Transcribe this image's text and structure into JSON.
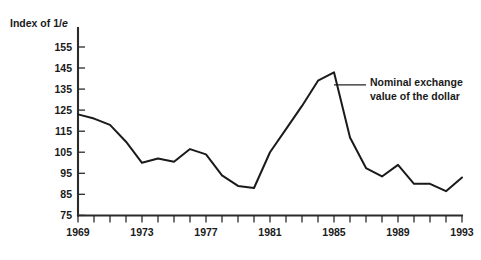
{
  "chart_data": {
    "type": "line",
    "title": "",
    "subtitle": "",
    "ylabel": "Index of 1/e",
    "ylabel_parts": {
      "prefix": "Index of 1/",
      "italic": "e"
    },
    "xlabel": "",
    "grid": false,
    "legend_position": "none",
    "ylim": [
      75,
      160
    ],
    "ytick_labels": [
      "155",
      "145",
      "135",
      "125",
      "115",
      "105",
      "95",
      "85",
      "75"
    ],
    "yticks": [
      155,
      145,
      135,
      125,
      115,
      105,
      95,
      85,
      75
    ],
    "xlim": [
      1969,
      1993
    ],
    "xtick_labels": [
      "1969",
      "1973",
      "1977",
      "1981",
      "1985",
      "1989",
      "1993"
    ],
    "xticks_labeled": [
      1969,
      1973,
      1977,
      1981,
      1985,
      1989,
      1993
    ],
    "xticks_minor": [
      1970,
      1971,
      1972,
      1974,
      1975,
      1976,
      1978,
      1979,
      1980,
      1982,
      1983,
      1984,
      1986,
      1987,
      1988,
      1990,
      1991,
      1992
    ],
    "series": [
      {
        "name": "Nominal exchange value of the dollar",
        "color": "#1a1a1a",
        "x": [
          1969,
          1970,
          1971,
          1972,
          1973,
          1974,
          1975,
          1976,
          1977,
          1978,
          1979,
          1980,
          1981,
          1982,
          1983,
          1984,
          1985,
          1986,
          1987,
          1988,
          1989,
          1990,
          1991,
          1992,
          1993
        ],
        "values": [
          123,
          121,
          118,
          110,
          100,
          102,
          100.5,
          106.5,
          104,
          94,
          89,
          88,
          105,
          116,
          127,
          139,
          143,
          112,
          97.5,
          93.5,
          99,
          90,
          90,
          86.5,
          93
        ]
      }
    ],
    "annotations": [
      {
        "text_line1": "Nominal exchange",
        "text_line2": "value of the dollar",
        "points_to_year": 1985,
        "points_to_value": 137
      }
    ]
  },
  "figure": {
    "background_color": "#ffffff",
    "axis_color": "#2b2b2b",
    "line_color": "#1a1a1a"
  }
}
